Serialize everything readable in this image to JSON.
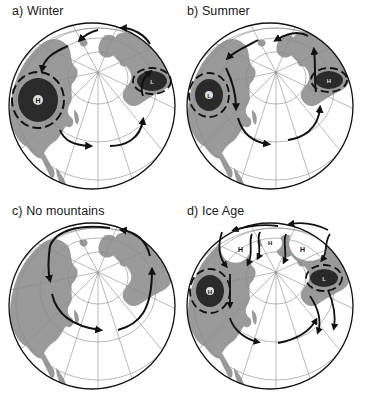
{
  "figure": {
    "colors": {
      "land": "#9a9a9a",
      "ocean": "#ffffff",
      "ice": "#ffffff",
      "outline": "#111111",
      "grid": "#8a8a8a",
      "arrow": "#111111",
      "pressure_fill": "#2a2a2a"
    },
    "panels": [
      {
        "id": "a",
        "label": "a) Winter",
        "systems": [
          {
            "type": "high",
            "symbol": "H",
            "position": "west (Siberia)",
            "style": "dark-ring"
          },
          {
            "type": "low",
            "symbol": "L",
            "position": "east (Iceland/Atlantic)",
            "style": "dark-ellipse"
          }
        ],
        "flow": "wavy westerly jet with arrows around pole"
      },
      {
        "id": "b",
        "label": "b) Summer",
        "systems": [
          {
            "type": "low",
            "symbol": "L",
            "position": "west (Asia)",
            "style": "dark-ring"
          },
          {
            "type": "high",
            "symbol": "H",
            "position": "east (Atlantic)",
            "style": "dark-ellipse"
          }
        ],
        "flow": "wavy westerly jet with arrows around pole"
      },
      {
        "id": "c",
        "label": "c) No mountains",
        "systems": [],
        "flow": "smooth circular westerly flow around pole"
      },
      {
        "id": "d",
        "label": "d) Ice Age",
        "systems": [
          {
            "type": "high",
            "symbol": "H",
            "position": "ice sheet west",
            "style": "white-ice"
          },
          {
            "type": "high",
            "symbol": "H",
            "position": "ice sheet center (small)",
            "style": "white-ice"
          },
          {
            "type": "high",
            "symbol": "H",
            "position": "ice sheet east",
            "style": "white-ice"
          },
          {
            "type": "high",
            "symbol": "H",
            "position": "west (Siberia)",
            "style": "dark-ring"
          },
          {
            "type": "low",
            "symbol": "L",
            "position": "east (Atlantic)",
            "style": "dark-ellipse"
          }
        ],
        "flow": "split jet around ice sheets with strong meanders"
      }
    ]
  }
}
